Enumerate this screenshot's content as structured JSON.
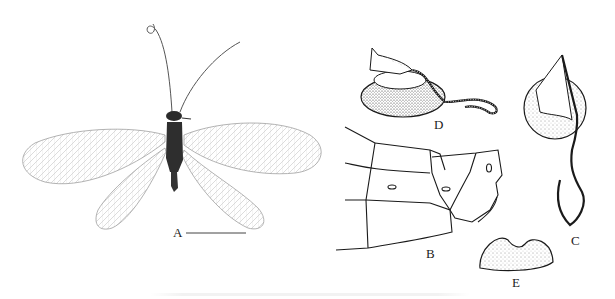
{
  "figure": {
    "panels": [
      {
        "id": "A",
        "label": "A",
        "description": "Habitus photograph of lacewing, dorsal view, wings spread",
        "has_scale_bar": true
      },
      {
        "id": "B",
        "label": "B",
        "description": "Terminal abdominal segments, lateral view (line drawing)"
      },
      {
        "id": "C",
        "label": "C",
        "description": "Spermatheca, lateral view (stippled drawing)"
      },
      {
        "id": "D",
        "label": "D",
        "description": "Spermatheca, dorsal view (stippled drawing)"
      },
      {
        "id": "E",
        "label": "E",
        "description": "Subgenitale (stippled drawing)"
      }
    ],
    "colors": {
      "background": "#ffffff",
      "ink": "#1a1a1a",
      "wing_vein": "#9a9a9a",
      "body": "#2a2a2a"
    }
  }
}
